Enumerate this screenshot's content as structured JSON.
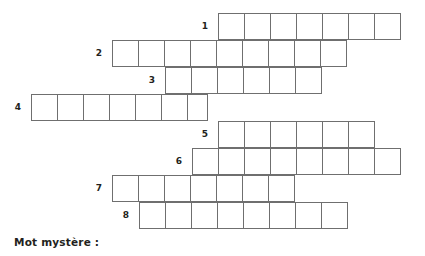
{
  "page": {
    "type": "word-puzzle-worksheet",
    "mystery_label": "Mot mystère :",
    "background_color": "#ffffff",
    "line_color": "#6f6f6f",
    "text_color": "#231f20"
  },
  "grid": {
    "cell_width": 26.7,
    "cell_height": 27,
    "mystery_column_x": 218,
    "rows": [
      {
        "number": "1",
        "cells": 7,
        "x": 218,
        "y": 13,
        "label_x": 200,
        "label_y": 27
      },
      {
        "number": "2",
        "cells": 9,
        "x": 112,
        "y": 40,
        "label_x": 94,
        "label_y": 54
      },
      {
        "number": "3",
        "cells": 6,
        "x": 165,
        "y": 67,
        "label_x": 147,
        "label_y": 81
      },
      {
        "number": "4",
        "cells": 6.5,
        "x": 31,
        "y": 94,
        "label_x": 13,
        "label_y": 108
      },
      {
        "number": "5",
        "cells": 6,
        "x": 218,
        "y": 121,
        "label_x": 200,
        "label_y": 135
      },
      {
        "number": "6",
        "cells": 8,
        "x": 192,
        "y": 148,
        "label_x": 174,
        "label_y": 162
      },
      {
        "number": "7",
        "cells": 7,
        "x": 112,
        "y": 175,
        "label_x": 94,
        "label_y": 189
      },
      {
        "number": "8",
        "cells": 8,
        "x": 139,
        "y": 202,
        "label_x": 121,
        "label_y": 216
      }
    ]
  }
}
